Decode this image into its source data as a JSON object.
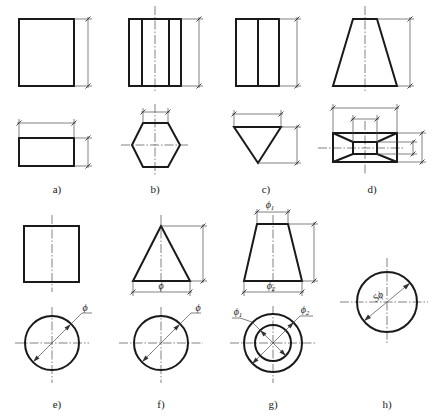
{
  "figure": {
    "panels": [
      {
        "id": "a",
        "label": "a)",
        "shape": "rectangular prism",
        "views": [
          "front: rectangle",
          "top: rectangle"
        ],
        "dimensions": [
          "height",
          "length",
          "width"
        ]
      },
      {
        "id": "b",
        "label": "b)",
        "shape": "hexagonal prism",
        "views": [
          "front: rectangle with two inner edges",
          "top: hexagon"
        ],
        "dimensions": [
          "height",
          "hexagon flat width"
        ]
      },
      {
        "id": "c",
        "label": "c)",
        "shape": "triangular prism",
        "views": [
          "front: rectangle with one inner edge",
          "top: triangle"
        ],
        "dimensions": [
          "height",
          "base width",
          "triangle depth"
        ]
      },
      {
        "id": "d",
        "label": "d)",
        "shape": "frustum of rectangular pyramid",
        "views": [
          "front: trapezoid",
          "top: nested rectangles"
        ],
        "dimensions": [
          "height",
          "outer length",
          "inner length",
          "outer width",
          "inner width"
        ]
      },
      {
        "id": "e",
        "label": "e)",
        "shape": "cylinder",
        "views": [
          "front: square",
          "top: circle"
        ],
        "dimensions": [
          "diameter"
        ]
      },
      {
        "id": "f",
        "label": "f)",
        "shape": "cone",
        "views": [
          "front: triangle",
          "top: circle"
        ],
        "dimensions": [
          "height",
          "base diameter"
        ]
      },
      {
        "id": "g",
        "label": "g)",
        "shape": "truncated cone",
        "views": [
          "front: trapezoid",
          "top: concentric circles"
        ],
        "dimensions": [
          "top diameter",
          "bottom diameter",
          "height"
        ]
      },
      {
        "id": "h",
        "label": "h)",
        "shape": "sphere",
        "views": [
          "single view: circle"
        ],
        "dimensions": [
          "sphere diameter"
        ]
      }
    ],
    "symbols": {
      "phi": "ϕ",
      "phi1_base": "ϕ",
      "phi1_sub": "1",
      "phi2_base": "ϕ",
      "phi2_sub": "2",
      "sphere_phi": "Sϕ"
    },
    "colors": {
      "line": "#1a1a1a",
      "thin_line": "#4a4a4a",
      "background": "#ffffff"
    }
  }
}
